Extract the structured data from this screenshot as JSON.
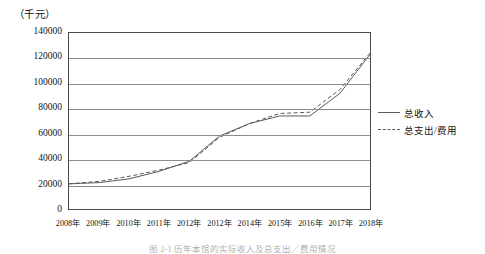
{
  "figure": {
    "unit_label": "（千元）",
    "caption": "图 2-1  历年本馆的实际收入及总支出／费用情况"
  },
  "legend": {
    "position": "right",
    "items": [
      {
        "label": "总收入",
        "style": "solid",
        "color": "#5a5a5a"
      },
      {
        "label": "总支出/费用",
        "style": "dashed",
        "color": "#5a5a5a"
      }
    ]
  },
  "axes": {
    "y_ticks": [
      "140000",
      "120000",
      "100000",
      "80000",
      "60000",
      "40000",
      "20000",
      "0"
    ],
    "x_labels": [
      "2008年",
      "2009年",
      "2010年",
      "2011年",
      "2012年",
      "2012年",
      "2014年",
      "2015年",
      "2016年",
      "2017年",
      "2018年"
    ]
  },
  "chart_data": {
    "type": "line",
    "title": "",
    "xlabel": "",
    "ylabel": "（千元）",
    "ylim": [
      0,
      140000
    ],
    "ytick_step": 20000,
    "grid": true,
    "legend_position": "right",
    "categories": [
      "2008年",
      "2009年",
      "2010年",
      "2011年",
      "2012年",
      "2012年",
      "2014年",
      "2015年",
      "2016年",
      "2017年",
      "2018年"
    ],
    "series": [
      {
        "name": "总收入",
        "style": "solid",
        "color": "#5a5a5a",
        "values": [
          20000,
          21000,
          24000,
          30000,
          38000,
          58000,
          68000,
          74000,
          74000,
          92000,
          123000
        ]
      },
      {
        "name": "总支出/费用",
        "style": "dashed",
        "color": "#5a5a5a",
        "values": [
          20000,
          22000,
          26000,
          31000,
          37000,
          57000,
          68000,
          76000,
          77000,
          95000,
          124000
        ]
      }
    ]
  }
}
